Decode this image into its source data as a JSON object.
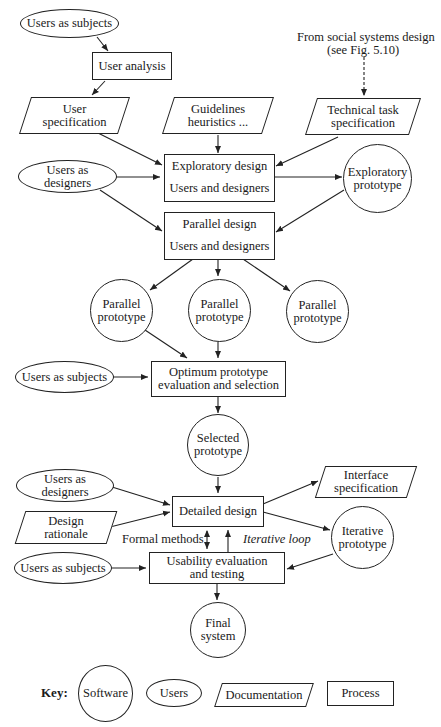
{
  "diagram": {
    "external_source": {
      "line1": "From social systems design",
      "line2": "(see Fig. 5.10)"
    },
    "nodes": {
      "users_subjects_1": "Users as subjects",
      "user_analysis": "User analysis",
      "user_spec": {
        "line1": "User",
        "line2": "specification"
      },
      "guidelines": {
        "line1": "Guidelines",
        "line2": "heuristics ..."
      },
      "tech_task_spec": {
        "line1": "Technical task",
        "line2": "specification"
      },
      "users_designers_1": {
        "line1": "Users as",
        "line2": "designers"
      },
      "exploratory_design": {
        "title": "Exploratory design",
        "subtitle": "Users and designers"
      },
      "exploratory_prototype": {
        "line1": "Exploratory",
        "line2": "prototype"
      },
      "parallel_design": {
        "title": "Parallel design",
        "subtitle": "Users and designers"
      },
      "parallel_prototypes": [
        {
          "line1": "Parallel",
          "line2": "prototype"
        },
        {
          "line1": "Parallel",
          "line2": "prototype"
        },
        {
          "line1": "Parallel",
          "line2": "prototype"
        }
      ],
      "users_subjects_2": "Users as subjects",
      "optimum_eval": {
        "line1": "Optimum prototype",
        "line2": "evaluation and selection"
      },
      "selected_prototype": {
        "line1": "Selected",
        "line2": "prototype"
      },
      "users_designers_2": {
        "line1": "Users as",
        "line2": "designers"
      },
      "design_rationale": {
        "line1": "Design",
        "line2": "rationale"
      },
      "detailed_design": "Detailed design",
      "interface_spec": {
        "line1": "Interface",
        "line2": "specification"
      },
      "iterative_prototype": {
        "line1": "Iterative",
        "line2": "prototype"
      },
      "users_subjects_3": "Users as subjects",
      "usability_eval": {
        "line1": "Usability evaluation",
        "line2": "and testing"
      },
      "final_system": {
        "line1": "Final",
        "line2": "system"
      }
    },
    "edge_labels": {
      "formal_methods": "Formal methods",
      "iterative_loop": "Iterative loop"
    },
    "key": {
      "title": "Key:",
      "software": "Software",
      "users": "Users",
      "documentation": "Documentation",
      "process": "Process"
    }
  }
}
